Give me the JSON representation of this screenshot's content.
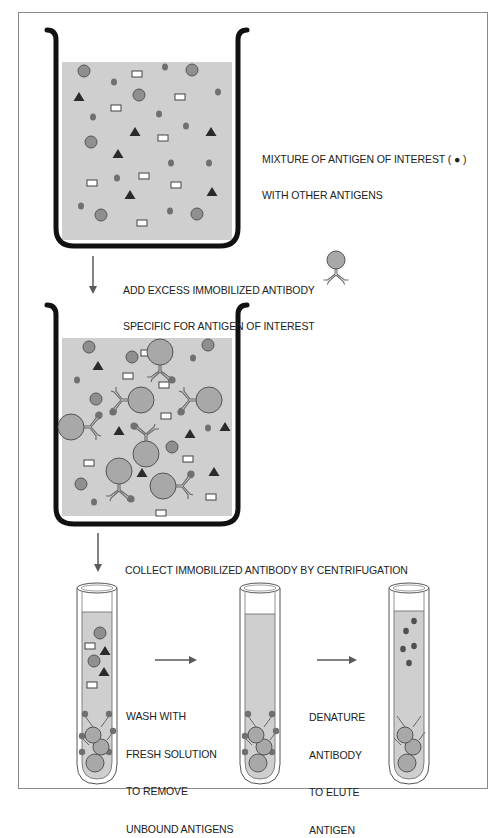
{
  "colors": {
    "liquid": "#cfcfcf",
    "beaker_wall": "#111111",
    "large_antigen": "#8f8f8f",
    "antigen_of_interest": "#707070",
    "triangle_antigen": "#2a2a2a",
    "rect_antigen_fill": "#ffffff",
    "bead": "#a8a8a8",
    "arrow": "#5a5a5a",
    "frame": "#8a8a8a"
  },
  "steps": {
    "step1": {
      "label_line1": "MIXTURE OF ANTIGEN OF INTEREST ( ● )",
      "label_line2": "WITH OTHER ANTIGENS"
    },
    "step2": {
      "label_line1": "ADD EXCESS IMMOBILIZED ANTIBODY",
      "label_line2": "SPECIFIC FOR ANTIGEN OF INTEREST",
      "legend_icon": "immobilized-antibody-icon"
    },
    "step3": {
      "label": "COLLECT IMMOBILIZED ANTIBODY BY CENTRIFUGATION"
    },
    "step4": {
      "label_line1": "WASH WITH",
      "label_line2": "FRESH SOLUTION",
      "label_line3": "TO REMOVE",
      "label_line4": "UNBOUND ANTIGENS"
    },
    "step5": {
      "label_line1": "DENATURE",
      "label_line2": "ANTIBODY",
      "label_line3": "TO ELUTE",
      "label_line4": "ANTIGEN"
    }
  },
  "beaker1": {
    "large_circles": [
      [
        84,
        71
      ],
      [
        192,
        70
      ],
      [
        139,
        95
      ],
      [
        91,
        142
      ],
      [
        101,
        215
      ],
      [
        197,
        214
      ]
    ],
    "small_dots": [
      [
        114,
        82
      ],
      [
        165,
        67
      ],
      [
        218,
        92
      ],
      [
        93,
        117
      ],
      [
        159,
        114
      ],
      [
        186,
        126
      ],
      [
        171,
        163
      ],
      [
        209,
        163
      ],
      [
        117,
        178
      ],
      [
        170,
        211
      ],
      [
        81,
        206
      ]
    ],
    "triangles": [
      [
        79,
        97
      ],
      [
        135,
        132
      ],
      [
        211,
        132
      ],
      [
        118,
        154
      ],
      [
        130,
        195
      ],
      [
        212,
        192
      ]
    ],
    "rectangles": [
      [
        137,
        74
      ],
      [
        180,
        97
      ],
      [
        116,
        108
      ],
      [
        163,
        138
      ],
      [
        92,
        183
      ],
      [
        144,
        176
      ],
      [
        176,
        185
      ],
      [
        142,
        223
      ]
    ]
  },
  "beaker2": {
    "large_circles": [
      [
        89,
        347
      ],
      [
        132,
        357
      ],
      [
        208,
        345
      ],
      [
        96,
        399
      ],
      [
        172,
        447
      ],
      [
        81,
        484
      ]
    ],
    "small_dots": [
      [
        77,
        380
      ],
      [
        193,
        358
      ],
      [
        208,
        428
      ],
      [
        94,
        502
      ]
    ],
    "triangles": [
      [
        98,
        366
      ],
      [
        119,
        431
      ],
      [
        190,
        434
      ],
      [
        225,
        427
      ],
      [
        142,
        473
      ],
      [
        214,
        472
      ]
    ],
    "rectangles": [
      [
        146,
        353
      ],
      [
        128,
        376
      ],
      [
        164,
        385
      ],
      [
        166,
        416
      ],
      [
        89,
        463
      ],
      [
        188,
        459
      ],
      [
        211,
        497
      ],
      [
        161,
        513
      ]
    ],
    "antibody_beads": [
      {
        "cx": 160,
        "cy": 352,
        "r": 13,
        "dir": "down"
      },
      {
        "cx": 141,
        "cy": 400,
        "r": 13,
        "dir": "left"
      },
      {
        "cx": 209,
        "cy": 400,
        "r": 13,
        "dir": "left"
      },
      {
        "cx": 71,
        "cy": 427,
        "r": 13,
        "dir": "right"
      },
      {
        "cx": 146,
        "cy": 454,
        "r": 13,
        "dir": "up"
      },
      {
        "cx": 119,
        "cy": 471,
        "r": 13,
        "dir": "down"
      },
      {
        "cx": 163,
        "cy": 486,
        "r": 13,
        "dir": "right"
      }
    ]
  },
  "tube1": {
    "large_circles": [
      [
        100,
        633
      ],
      [
        94,
        661
      ]
    ],
    "small_dots": [],
    "triangles": [
      [
        105,
        651
      ],
      [
        104,
        672
      ]
    ],
    "rectangles": [
      [
        90,
        646
      ],
      [
        92,
        685
      ]
    ]
  },
  "tube3": {
    "dots": [
      [
        406,
        631
      ],
      [
        414,
        621
      ],
      [
        403,
        649
      ],
      [
        414,
        646
      ],
      [
        409,
        663
      ]
    ]
  }
}
